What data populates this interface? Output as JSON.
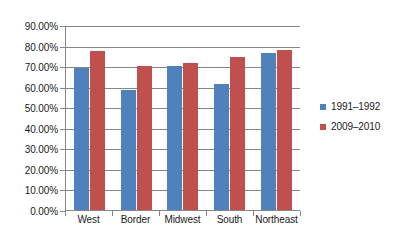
{
  "chart_data": {
    "type": "bar",
    "title": "",
    "subtitle": "",
    "xlabel": "",
    "ylabel": "",
    "categories": [
      "West",
      "Border",
      "Midwest",
      "South",
      "Northeast"
    ],
    "series": [
      {
        "name": "1991–1992",
        "color": "#4f81bd",
        "values": [
          69.3,
          58.5,
          70.0,
          61.3,
          76.3
        ]
      },
      {
        "name": "2009–2010",
        "color": "#c0504d",
        "values": [
          77.5,
          69.9,
          71.6,
          74.2,
          78.0
        ]
      }
    ],
    "ylim": [
      0,
      90
    ],
    "ytick_values": [
      0,
      10,
      20,
      30,
      40,
      50,
      60,
      70,
      80,
      90
    ],
    "ytick_labels": [
      "0.00%",
      "10.00%",
      "20.00%",
      "30.00%",
      "40.00%",
      "50.00%",
      "60.00%",
      "70.00%",
      "80.00%",
      "90.00%"
    ],
    "value_format": "percent",
    "grid": true,
    "grid_axis": "y",
    "legend_position": "right",
    "axis_color": "#868686",
    "plot_background": "#ffffff"
  },
  "legend": {
    "entries": [
      {
        "label": "1991–1992"
      },
      {
        "label": "2009–2010"
      }
    ]
  }
}
